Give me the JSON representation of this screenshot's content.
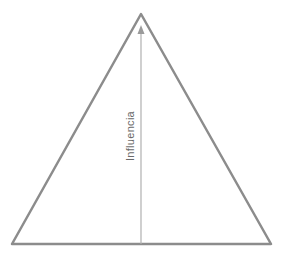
{
  "diagram": {
    "type": "pyramid",
    "axis": {
      "label": "Influencia",
      "direction": "up"
    },
    "colors": {
      "outline": "#8c8c8c",
      "axis": "#b0b0b0",
      "arrowhead": "#9a9a9a",
      "label": "#6a6a6a",
      "background": "#ffffff"
    }
  }
}
